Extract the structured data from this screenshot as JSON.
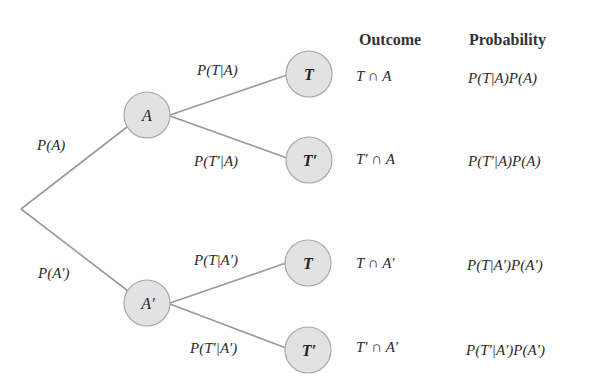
{
  "colors": {
    "line": "#9a9a9a",
    "node_fill": "#e2e2e2",
    "node_stroke": "#a8a8a8",
    "text": "#2a2a2a"
  },
  "headers": {
    "outcome": "Outcome",
    "probability": "Probability"
  },
  "root": {
    "x": 21,
    "y": 209
  },
  "nodes": [
    {
      "id": "A",
      "label": "A",
      "x": 147,
      "y": 115,
      "r": 23
    },
    {
      "id": "A_prime",
      "label": "A′",
      "x": 147,
      "y": 303,
      "r": 23
    },
    {
      "id": "T_A",
      "label": "T",
      "x": 309,
      "y": 74,
      "r": 23
    },
    {
      "id": "Tp_A",
      "label": "T′",
      "x": 309,
      "y": 160,
      "r": 23
    },
    {
      "id": "T_Ap",
      "label": "T",
      "x": 308,
      "y": 263,
      "r": 23
    },
    {
      "id": "Tp_Ap",
      "label": "T′",
      "x": 308,
      "y": 350,
      "r": 23
    }
  ],
  "branch_labels": {
    "p_A": "P(A)",
    "p_A_prime": "P(A′)",
    "p_T_given_A": "P(T|A)",
    "p_Tp_given_A": "P(T′|A)",
    "p_T_given_Ap": "P(T|A′)",
    "p_Tp_given_Ap": "P(T′|A′)"
  },
  "rows": [
    {
      "outcome": "T ∩ A",
      "probability": "P(T|A)P(A)"
    },
    {
      "outcome": "T′ ∩ A",
      "probability": "P(T′|A)P(A)"
    },
    {
      "outcome": "T ∩ A′",
      "probability": "P(T|A′)P(A′)"
    },
    {
      "outcome": "T′ ∩ A′",
      "probability": "P(T′|A′)P(A′)"
    }
  ]
}
